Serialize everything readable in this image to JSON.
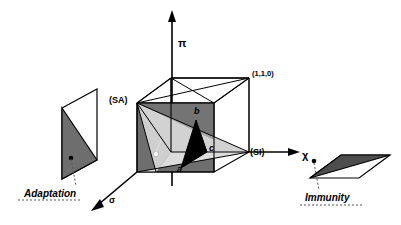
{
  "figure": {
    "title": "",
    "type": "3d-geometric-diagram",
    "background_color": "#ffffff",
    "stroke_color": "#000000"
  },
  "axes": [
    {
      "id": "vertical",
      "label": "π",
      "name": "pi-axis",
      "direction": "up"
    },
    {
      "id": "horizontal",
      "label": "χ",
      "name": "chi-axis",
      "direction": "right"
    },
    {
      "id": "depth",
      "label": "σ",
      "name": "sigma-axis",
      "direction": "down-left"
    }
  ],
  "cube": {
    "name": "unit-cube",
    "vertex_labels": [
      {
        "id": "sa",
        "text": "(SA)",
        "name": "vertex-label-sa"
      },
      {
        "id": "si",
        "text": "(SI)",
        "name": "vertex-label-si"
      },
      {
        "id": "110",
        "text": "(1,1,0)",
        "name": "vertex-label-110"
      }
    ],
    "region_labels": [
      {
        "id": "a",
        "text": "a",
        "name": "region-label-a"
      },
      {
        "id": "b",
        "text": "b",
        "name": "region-label-b"
      },
      {
        "id": "c",
        "text": "c",
        "name": "region-label-c"
      }
    ],
    "fills": {
      "left_face": "#6e6e6e",
      "light_wedge": "#d2d2d2",
      "mid_wedge": "#c8c8c8",
      "black_triangle": "#000000",
      "white_marker": "#ffffff"
    }
  },
  "panels": [
    {
      "id": "adaptation",
      "caption": "Adaptation",
      "name": "adaptation-panel",
      "fill": "#6e6e6e",
      "marker": "dot",
      "leader": "dashed"
    },
    {
      "id": "immunity",
      "caption": "Immunity",
      "name": "immunity-panel",
      "fill": "#4d4d4d",
      "marker": "dot",
      "leader": "dashed"
    }
  ]
}
